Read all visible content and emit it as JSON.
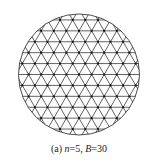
{
  "figure": {
    "caption_prefix": "(a) ",
    "n_label": "n",
    "n_value": "=5, ",
    "b_label": "B",
    "b_value": "=30",
    "circle": {
      "cx": 79,
      "cy": 74.5,
      "r": 60.5
    },
    "grid": {
      "spacing": 12.6,
      "type": "triangular"
    },
    "colors": {
      "line": "#3a3a3a",
      "node": "#111111",
      "background": "#ffffff"
    }
  }
}
